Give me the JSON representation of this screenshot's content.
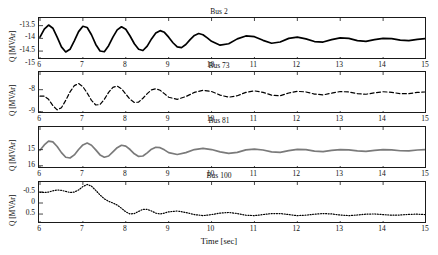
{
  "figure": {
    "xlabel": "Time [sec]",
    "xticks": [
      "6",
      "7",
      "8",
      "9",
      "10",
      "11",
      "12",
      "13",
      "14",
      "15"
    ],
    "xlim": [
      6,
      15
    ]
  },
  "chart_data": [
    {
      "type": "line",
      "title": "Bus 2",
      "xlabel": "",
      "ylabel": "Q [MVAr]",
      "xlim": [
        6,
        15
      ],
      "ylim": [
        -13.2,
        -14.85
      ],
      "yticks": [
        "-13.5",
        "-14",
        "-14.5",
        "-15"
      ],
      "ytick_values": [
        -13.5,
        -14,
        -14.5,
        -15
      ],
      "grid": false,
      "linestyle": "solid",
      "color": "#000000",
      "x": [
        6.0,
        6.1,
        6.2,
        6.3,
        6.4,
        6.5,
        6.6,
        6.7,
        6.8,
        6.9,
        7.0,
        7.1,
        7.2,
        7.3,
        7.4,
        7.5,
        7.6,
        7.7,
        7.8,
        7.9,
        8.0,
        8.1,
        8.2,
        8.3,
        8.4,
        8.5,
        8.6,
        8.7,
        8.8,
        8.9,
        9.0,
        9.1,
        9.2,
        9.3,
        9.4,
        9.5,
        9.6,
        9.7,
        9.8,
        9.9,
        10.0,
        10.2,
        10.4,
        10.6,
        10.8,
        11.0,
        11.2,
        11.4,
        11.6,
        11.8,
        12.0,
        12.2,
        12.4,
        12.6,
        12.8,
        13.0,
        13.2,
        13.4,
        13.6,
        13.8,
        14.0,
        14.2,
        14.4,
        14.6,
        14.8,
        15.0
      ],
      "y": [
        -13.95,
        -13.62,
        -13.45,
        -13.58,
        -13.95,
        -14.35,
        -14.56,
        -14.45,
        -14.1,
        -13.72,
        -13.5,
        -13.55,
        -13.85,
        -14.25,
        -14.52,
        -14.55,
        -14.3,
        -13.95,
        -13.65,
        -13.52,
        -13.62,
        -13.9,
        -14.22,
        -14.45,
        -14.5,
        -14.32,
        -14.02,
        -13.78,
        -13.68,
        -13.75,
        -13.95,
        -14.18,
        -14.35,
        -14.38,
        -14.25,
        -14.05,
        -13.88,
        -13.8,
        -13.85,
        -13.98,
        -14.12,
        -14.28,
        -14.22,
        -14.02,
        -13.9,
        -13.93,
        -14.08,
        -14.2,
        -14.15,
        -14.0,
        -13.95,
        -14.02,
        -14.13,
        -14.15,
        -14.05,
        -13.98,
        -14.0,
        -14.09,
        -14.12,
        -14.05,
        -14.0,
        -14.01,
        -14.07,
        -14.09,
        -14.04,
        -14.01
      ]
    },
    {
      "type": "line",
      "title": "Bus 73",
      "xlabel": "",
      "ylabel": "Q [MVAr]",
      "xlim": [
        6,
        15
      ],
      "ylim": [
        -7.2,
        -9.1
      ],
      "yticks": [
        "-8",
        "-9"
      ],
      "ytick_values": [
        -8,
        -9
      ],
      "grid": false,
      "linestyle": "dashed",
      "color": "#000000",
      "x": [
        6.0,
        6.1,
        6.2,
        6.3,
        6.4,
        6.5,
        6.6,
        6.7,
        6.8,
        6.9,
        7.0,
        7.1,
        7.2,
        7.3,
        7.4,
        7.5,
        7.6,
        7.7,
        7.8,
        7.9,
        8.0,
        8.1,
        8.2,
        8.3,
        8.4,
        8.5,
        8.6,
        8.7,
        8.8,
        8.9,
        9.0,
        9.2,
        9.4,
        9.6,
        9.8,
        10.0,
        10.2,
        10.4,
        10.6,
        10.8,
        11.0,
        11.2,
        11.4,
        11.6,
        11.8,
        12.0,
        12.2,
        12.4,
        12.6,
        12.8,
        13.0,
        13.2,
        13.4,
        13.6,
        13.8,
        14.0,
        14.2,
        14.4,
        14.6,
        14.8,
        15.0
      ],
      "y": [
        -8.3,
        -8.3,
        -8.45,
        -8.75,
        -8.95,
        -8.85,
        -8.5,
        -8.1,
        -7.8,
        -7.7,
        -7.85,
        -8.15,
        -8.5,
        -8.72,
        -8.7,
        -8.45,
        -8.12,
        -7.88,
        -7.82,
        -7.95,
        -8.2,
        -8.45,
        -8.6,
        -8.58,
        -8.4,
        -8.18,
        -8.0,
        -7.95,
        -8.02,
        -8.18,
        -8.35,
        -8.45,
        -8.32,
        -8.12,
        -8.02,
        -8.08,
        -8.25,
        -8.35,
        -8.28,
        -8.12,
        -8.05,
        -8.12,
        -8.25,
        -8.28,
        -8.15,
        -8.07,
        -8.1,
        -8.2,
        -8.24,
        -8.16,
        -8.08,
        -8.1,
        -8.18,
        -8.21,
        -8.14,
        -8.09,
        -8.12,
        -8.18,
        -8.18,
        -8.12,
        -8.1
      ]
    },
    {
      "type": "line",
      "title": "Bus 81",
      "xlabel": "",
      "ylabel": "Q [MVAr]",
      "xlim": [
        6,
        15
      ],
      "ylim": [
        13.6,
        16.2
      ],
      "yticks": [
        "16",
        "15"
      ],
      "ytick_values": [
        16,
        15
      ],
      "grid": false,
      "linestyle": "solid",
      "color": "#7a7a7a",
      "x": [
        6.0,
        6.1,
        6.2,
        6.3,
        6.4,
        6.5,
        6.6,
        6.7,
        6.8,
        6.9,
        7.0,
        7.1,
        7.2,
        7.3,
        7.4,
        7.5,
        7.6,
        7.7,
        7.8,
        7.9,
        8.0,
        8.1,
        8.2,
        8.3,
        8.4,
        8.5,
        8.6,
        8.7,
        8.8,
        8.9,
        9.0,
        9.2,
        9.4,
        9.6,
        9.8,
        10.0,
        10.2,
        10.4,
        10.6,
        10.8,
        11.0,
        11.2,
        11.4,
        11.6,
        11.8,
        12.0,
        12.2,
        12.4,
        12.6,
        12.8,
        13.0,
        13.2,
        13.4,
        13.6,
        13.8,
        14.0,
        14.2,
        14.4,
        14.6,
        14.8,
        15.0
      ],
      "y": [
        15.05,
        14.7,
        14.45,
        14.5,
        14.8,
        15.2,
        15.5,
        15.55,
        15.35,
        15.0,
        14.7,
        14.58,
        14.72,
        15.02,
        15.35,
        15.5,
        15.42,
        15.15,
        14.88,
        14.72,
        14.78,
        15.0,
        15.28,
        15.45,
        15.42,
        15.22,
        14.98,
        14.85,
        14.88,
        15.02,
        15.2,
        15.32,
        15.2,
        15.0,
        14.92,
        15.0,
        15.15,
        15.25,
        15.18,
        15.02,
        14.97,
        15.03,
        15.15,
        15.18,
        15.07,
        14.99,
        15.01,
        15.1,
        15.14,
        15.06,
        15.0,
        15.02,
        15.09,
        15.12,
        15.05,
        15.0,
        15.02,
        15.08,
        15.09,
        15.03,
        15.0
      ]
    },
    {
      "type": "line",
      "title": "Bus 100",
      "xlabel": "Time [sec]",
      "ylabel": "Q [MVAr]",
      "xlim": [
        6,
        15
      ],
      "ylim": [
        -0.95,
        0.95
      ],
      "yticks": [
        "0.5",
        "0",
        "-0.5"
      ],
      "ytick_values": [
        0.5,
        0,
        -0.5
      ],
      "grid": false,
      "linestyle": "dotted",
      "color": "#000000",
      "x": [
        6.0,
        6.1,
        6.2,
        6.3,
        6.4,
        6.5,
        6.6,
        6.7,
        6.8,
        6.9,
        7.0,
        7.1,
        7.2,
        7.3,
        7.4,
        7.5,
        7.6,
        7.7,
        7.8,
        7.9,
        8.0,
        8.1,
        8.2,
        8.3,
        8.4,
        8.5,
        8.6,
        8.7,
        8.8,
        8.9,
        9.0,
        9.2,
        9.4,
        9.6,
        9.8,
        10.0,
        10.2,
        10.4,
        10.6,
        10.8,
        11.0,
        11.2,
        11.4,
        11.6,
        11.8,
        12.0,
        12.2,
        12.4,
        12.6,
        12.8,
        13.0,
        13.2,
        13.4,
        13.6,
        13.8,
        14.0,
        14.2,
        14.4,
        14.6,
        14.8,
        15.0
      ],
      "y": [
        -0.5,
        -0.5,
        -0.52,
        -0.58,
        -0.62,
        -0.6,
        -0.55,
        -0.5,
        -0.52,
        -0.62,
        -0.78,
        -0.88,
        -0.8,
        -0.6,
        -0.38,
        -0.2,
        -0.08,
        0.0,
        0.1,
        0.25,
        0.42,
        0.52,
        0.5,
        0.4,
        0.3,
        0.3,
        0.38,
        0.48,
        0.52,
        0.48,
        0.42,
        0.38,
        0.45,
        0.55,
        0.6,
        0.55,
        0.48,
        0.45,
        0.5,
        0.58,
        0.6,
        0.55,
        0.5,
        0.5,
        0.55,
        0.6,
        0.58,
        0.53,
        0.5,
        0.52,
        0.57,
        0.6,
        0.57,
        0.53,
        0.52,
        0.55,
        0.58,
        0.57,
        0.54,
        0.53,
        0.55
      ]
    }
  ]
}
